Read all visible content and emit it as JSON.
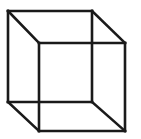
{
  "figure": {
    "name": "necker-cube",
    "width": 141,
    "height": 139,
    "background_color": "#ffffff",
    "line_color": "#1a1a1a",
    "line_width": 2.6,
    "line_cap": "square",
    "line_join": "miter"
  },
  "chart_data": {
    "type": "diagram",
    "projection": "parallel (oblique)",
    "grid": false,
    "legend": null,
    "xlabel": "",
    "ylabel": "",
    "xlim": [
      0,
      141
    ],
    "ylim": [
      0,
      139
    ],
    "vertices": {
      "back_top_left": [
        8,
        11
      ],
      "back_top_right": [
        92,
        11
      ],
      "back_bottom_right": [
        92,
        102
      ],
      "back_bottom_left": [
        8,
        102
      ],
      "front_top_left": [
        39,
        43
      ],
      "front_top_right": [
        125,
        43
      ],
      "front_bottom_right": [
        125,
        131
      ],
      "front_bottom_left": [
        39,
        131
      ]
    },
    "edges": [
      {
        "name": "back-top",
        "from": "back_top_left",
        "to": "back_top_right"
      },
      {
        "name": "back-right",
        "from": "back_top_right",
        "to": "back_bottom_right"
      },
      {
        "name": "back-bottom",
        "from": "back_bottom_right",
        "to": "back_bottom_left"
      },
      {
        "name": "back-left",
        "from": "back_bottom_left",
        "to": "back_top_left"
      },
      {
        "name": "front-top",
        "from": "front_top_left",
        "to": "front_top_right"
      },
      {
        "name": "front-right",
        "from": "front_top_right",
        "to": "front_bottom_right"
      },
      {
        "name": "front-bottom",
        "from": "front_bottom_right",
        "to": "front_bottom_left"
      },
      {
        "name": "front-left",
        "from": "front_bottom_left",
        "to": "front_top_left"
      },
      {
        "name": "connector-top-left",
        "from": "back_top_left",
        "to": "front_top_left"
      },
      {
        "name": "connector-top-right",
        "from": "back_top_right",
        "to": "front_top_right"
      },
      {
        "name": "connector-bottom-left",
        "from": "back_bottom_left",
        "to": "front_bottom_left"
      },
      {
        "name": "connector-bottom-right",
        "from": "back_bottom_right",
        "to": "front_bottom_right"
      }
    ]
  }
}
